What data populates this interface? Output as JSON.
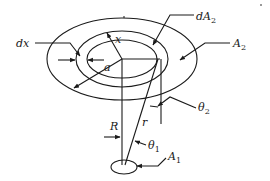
{
  "figure": {
    "type": "geometry-diagram",
    "labels": {
      "dx": "dx",
      "x": "x",
      "a": "a",
      "dA2_main": "dA",
      "dA2_sub": "2",
      "A2_main": "A",
      "A2_sub": "2",
      "theta2_main": "θ",
      "theta2_sub": "2",
      "R": "R",
      "r": "r",
      "theta1_main": "θ",
      "theta1_sub": "1",
      "A1_main": "A",
      "A1_sub": "1"
    },
    "colors": {
      "ink": "#1a1a1a",
      "background": "#ffffff"
    }
  }
}
